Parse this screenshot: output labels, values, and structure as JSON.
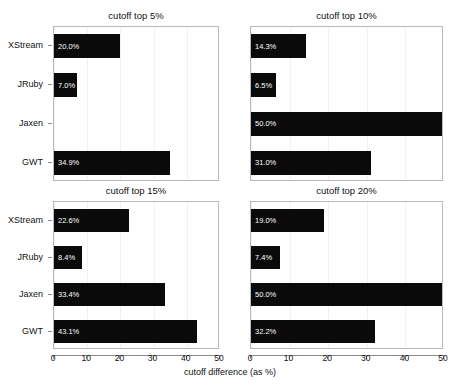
{
  "chart_data": {
    "type": "bar",
    "title": "",
    "xlabel": "cutoff difference (as %)",
    "ylabel": "",
    "orientation": "horizontal",
    "grid": true,
    "legend": "none",
    "categories": [
      "XStream",
      "JRuby",
      "Jaxen",
      "GWT"
    ],
    "panel_layout": {
      "rows": 2,
      "cols": 2
    },
    "panels": [
      {
        "title": "cutoff top 5%",
        "position": "top-left",
        "xlim": [
          0,
          50
        ],
        "xticks": [
          0,
          10,
          20,
          30,
          40,
          50
        ],
        "values": [
          20.0,
          7.0,
          0.0,
          34.9
        ],
        "labels": [
          "20.0%",
          "7.0%",
          "",
          "34.9%"
        ]
      },
      {
        "title": "cutoff top 10%",
        "position": "top-right",
        "xlim": [
          0,
          50
        ],
        "xticks": [
          0,
          10,
          20,
          30,
          40,
          50
        ],
        "values": [
          14.3,
          6.5,
          50.0,
          31.0
        ],
        "labels": [
          "14.3%",
          "6.5%",
          "50.0%",
          "31.0%"
        ]
      },
      {
        "title": "cutoff top 15%",
        "position": "bottom-left",
        "xlim": [
          0,
          50
        ],
        "xticks": [
          0,
          10,
          20,
          30,
          40,
          50
        ],
        "values": [
          22.6,
          8.4,
          33.4,
          43.1
        ],
        "labels": [
          "22.6%",
          "8.4%",
          "33.4%",
          "43.1%"
        ]
      },
      {
        "title": "cutoff top 20%",
        "position": "bottom-right",
        "xlim": [
          0,
          50
        ],
        "xticks": [
          0,
          10,
          20,
          30,
          40,
          50
        ],
        "values": [
          19.0,
          7.4,
          50.0,
          32.2
        ],
        "labels": [
          "19.0%",
          "7.4%",
          "50.0%",
          "32.2%"
        ]
      }
    ],
    "colors": {
      "bar": "#0a0a0a",
      "bar_label": "#ffffff",
      "panel_border": "#b9b9b9",
      "grid": "#f1f1f1",
      "axis": "#8a8a8a",
      "text": "#111111",
      "background": "#ffffff"
    }
  },
  "axis": {
    "xlabel": "cutoff difference (as %)",
    "xticks": [
      "0",
      "10",
      "20",
      "30",
      "40",
      "50"
    ],
    "yticks": [
      "XStream",
      "JRuby",
      "Jaxen",
      "GWT"
    ]
  },
  "panel_titles": {
    "top_left": "cutoff top 5%",
    "top_right": "cutoff top 10%",
    "bottom_left": "cutoff top 15%",
    "bottom_right": "cutoff top 20%"
  }
}
